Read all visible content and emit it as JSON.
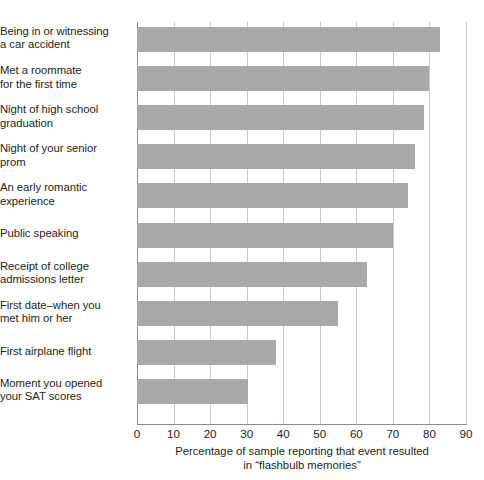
{
  "chart_data": {
    "type": "bar",
    "orientation": "horizontal",
    "title": "",
    "xlabel": "Percentage of sample reporting that event resulted in “flashbulb memories”",
    "ylabel": "",
    "xlim": [
      0,
      90
    ],
    "xticks": [
      0,
      10,
      20,
      30,
      40,
      50,
      60,
      70,
      80,
      90
    ],
    "xtick_labels": [
      "0",
      "10",
      "20",
      "30",
      "40",
      "50",
      "60",
      "70",
      "80",
      "90"
    ],
    "grid": true,
    "grid_axis": "x",
    "legend": null,
    "bar_color": "#a9a9a9",
    "categories": [
      "Being in or witnessing a car accident",
      "Met a roommate for the first time",
      "Night of high school graduation",
      "Night of your senior prom",
      "An early romantic experience",
      "Public speaking",
      "Receipt of college admissions letter",
      "First date–when you met him or her",
      "First airplane flight",
      "Moment you opened your SAT scores"
    ],
    "values": [
      83,
      80,
      78.5,
      76,
      74,
      70,
      63,
      55,
      38,
      30.5
    ]
  },
  "axis_caption": {
    "line1": "Percentage of sample reporting that event resulted",
    "line2": "in “flashbulb memories”"
  },
  "category_label_lines": [
    [
      "Being in or witnessing",
      "a car accident"
    ],
    [
      "Met a roommate",
      "for the first time"
    ],
    [
      "Night of high school",
      "graduation"
    ],
    [
      "Night of your senior",
      "prom"
    ],
    [
      "An early romantic",
      "experience"
    ],
    [
      "Public speaking"
    ],
    [
      "Receipt of college",
      "admissions letter"
    ],
    [
      "First date–when you",
      "met him or her"
    ],
    [
      "First airplane flight"
    ],
    [
      "Moment you opened",
      "your SAT scores"
    ]
  ]
}
